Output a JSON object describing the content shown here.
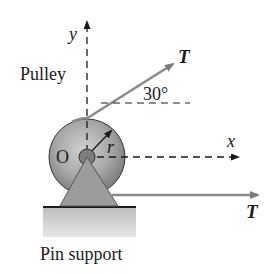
{
  "labels": {
    "y_axis": "y",
    "x_axis": "x",
    "pulley": "Pulley",
    "angle": "30°",
    "origin": "O",
    "radius": "r",
    "tension_upper": "T",
    "tension_lower": "T",
    "support": "Pin support"
  },
  "geometry": {
    "angle_deg": 30
  },
  "colors": {
    "rope": "#8a8a8a",
    "pulley_face": "#a9a9a9",
    "support": "#9a9a9a",
    "ground": "#c8c8c8",
    "ink": "#1a1a1a"
  }
}
